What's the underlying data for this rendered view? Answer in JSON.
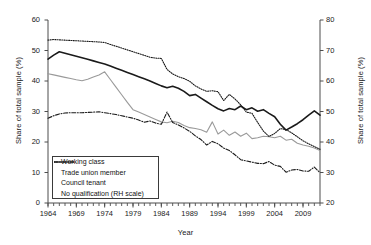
{
  "chart_data": {
    "type": "line",
    "title": "",
    "xlabel": "Year",
    "ylabel": "Share of total sample (%)",
    "ylabel_right": "Share of total sample (%)",
    "xlim": [
      1964,
      2012
    ],
    "ylim": [
      0,
      60
    ],
    "ylim_right": [
      20,
      80
    ],
    "grid": false,
    "legend_position": "lower-left-inside",
    "xticks": [
      1964,
      1969,
      1974,
      1979,
      1984,
      1989,
      1994,
      1999,
      2004,
      2009
    ],
    "xtick_labels": [
      "1964",
      "1969",
      "1974",
      "1979",
      "1984",
      "1989",
      "1994",
      "1999",
      "2004",
      "2009"
    ],
    "yticks_left": [
      0,
      10,
      20,
      30,
      40,
      50,
      60
    ],
    "ytick_labels_left": [
      "0",
      "10",
      "20",
      "30",
      "40",
      "50",
      "60"
    ],
    "yticks_right": [
      20,
      30,
      40,
      50,
      60,
      70,
      80
    ],
    "ytick_labels_right": [
      "20",
      "30",
      "40",
      "50",
      "60",
      "70",
      "80"
    ],
    "x": [
      1964,
      1965,
      1966,
      1967,
      1968,
      1969,
      1970,
      1971,
      1972,
      1973,
      1974,
      1975,
      1976,
      1977,
      1978,
      1979,
      1980,
      1981,
      1982,
      1983,
      1984,
      1985,
      1986,
      1987,
      1988,
      1989,
      1990,
      1991,
      1992,
      1993,
      1994,
      1995,
      1996,
      1997,
      1998,
      1999,
      2000,
      2001,
      2002,
      2003,
      2004,
      2005,
      2006,
      2007,
      2008,
      2009,
      2010,
      2011,
      2012
    ],
    "series": [
      {
        "name": "Working class",
        "axis": "left",
        "style": "solid",
        "color": "#1a1a1a",
        "width": 1.6,
        "values": [
          47.2,
          48.5,
          49.6,
          49.1,
          48.6,
          48.1,
          47.6,
          47.1,
          46.6,
          46.1,
          45.6,
          44.9,
          44.2,
          43.5,
          42.8,
          42.1,
          41.4,
          40.7,
          40.0,
          39.2,
          38.4,
          37.8,
          38.3,
          37.6,
          36.6,
          35.2,
          35.6,
          34.4,
          33.2,
          32.0,
          30.9,
          30.2,
          31.0,
          30.6,
          31.8,
          30.6,
          31.2,
          30.1,
          30.6,
          29.4,
          28.3,
          25.8,
          23.9,
          24.9,
          26.0,
          27.3,
          28.8,
          30.2,
          28.8
        ]
      },
      {
        "name": "Trade union member",
        "axis": "left",
        "style": "solid",
        "color": "#9a9a9a",
        "width": 1.1,
        "values": [
          42.4,
          42.0,
          41.6,
          41.2,
          40.8,
          40.4,
          40.1,
          40.6,
          41.3,
          42.0,
          43.0,
          40.5,
          38.0,
          35.5,
          33.0,
          30.6,
          29.8,
          29.0,
          28.2,
          27.4,
          26.6,
          26.3,
          26.8,
          26.4,
          25.4,
          24.7,
          24.4,
          24.0,
          23.2,
          26.6,
          22.6,
          23.9,
          22.2,
          23.3,
          21.9,
          22.9,
          21.1,
          21.4,
          21.9,
          21.7,
          21.4,
          21.9,
          20.6,
          20.9,
          19.6,
          19.0,
          18.6,
          18.0,
          17.2
        ]
      },
      {
        "name": "Council tenant",
        "axis": "left",
        "style": "dashdot",
        "color": "#1a1a1a",
        "width": 1.1,
        "values": [
          27.8,
          28.6,
          29.2,
          29.5,
          29.6,
          29.6,
          29.6,
          29.7,
          29.8,
          29.9,
          29.6,
          29.3,
          29.0,
          28.6,
          28.2,
          27.8,
          27.2,
          26.5,
          26.9,
          26.2,
          25.8,
          29.8,
          26.4,
          25.6,
          24.6,
          23.5,
          22.0,
          20.8,
          19.0,
          20.2,
          19.4,
          18.0,
          17.2,
          15.8,
          14.2,
          13.8,
          13.4,
          13.0,
          12.9,
          13.6,
          12.4,
          12.0,
          10.1,
          10.8,
          11.0,
          10.5,
          10.4,
          11.8,
          9.9
        ]
      },
      {
        "name": "No qualification (RH scale)",
        "axis": "right",
        "style": "dotted",
        "color": "#1a1a1a",
        "width": 1.1,
        "values": [
          73.4,
          73.6,
          73.5,
          73.4,
          73.3,
          73.2,
          73.1,
          73.0,
          72.9,
          72.8,
          72.6,
          72.0,
          71.4,
          70.8,
          70.2,
          69.6,
          69.0,
          68.4,
          67.8,
          67.5,
          67.4,
          63.8,
          62.3,
          61.4,
          60.8,
          59.9,
          58.4,
          57.4,
          56.6,
          56.8,
          56.5,
          53.6,
          55.6,
          54.1,
          52.2,
          49.8,
          49.4,
          46.4,
          43.6,
          41.8,
          42.8,
          44.4,
          44.1,
          43.0,
          41.7,
          40.4,
          39.4,
          38.5,
          37.6
        ]
      }
    ]
  },
  "legend": {
    "items": [
      {
        "label": "Working class"
      },
      {
        "label": "Trade union member"
      },
      {
        "label": "Council tenant"
      },
      {
        "label": "No qualification (RH scale)"
      }
    ]
  }
}
